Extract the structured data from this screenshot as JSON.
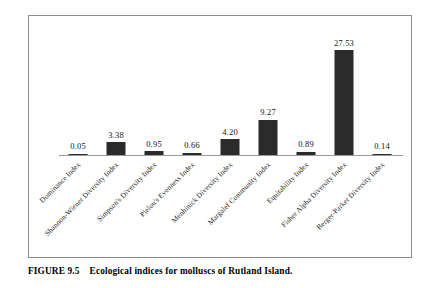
{
  "figure": {
    "caption_label": "FIGURE 9.5",
    "caption_text": "Ecological indices for molluscs of Rutland Island.",
    "frame_color": "#8d8d8d",
    "bar_color": "#2b2b2b",
    "axis_color": "#9a9a9a"
  },
  "chart_data": {
    "type": "bar",
    "title": "",
    "subtitle": "",
    "xlabel": "",
    "ylabel": "",
    "grid": false,
    "legend": null,
    "ylim": [
      0,
      31
    ],
    "categories": [
      "Dominance Index",
      "Shannon-Wiener Diversity Index",
      "Simpson's Diversity Index",
      "Pielou's Evenness Index",
      "Menhinick Diversity Index",
      "Margalef Community Index",
      "Equitability Index",
      "Fisher Alpha Diversity Index",
      "Berger-Parker Diversity Index"
    ],
    "values": [
      0.05,
      3.38,
      0.95,
      0.66,
      4.2,
      9.27,
      0.89,
      27.53,
      0.14
    ],
    "value_labels": [
      "0.05",
      "3.38",
      "0.95",
      "0.66",
      "4.20",
      "9.27",
      "0.89",
      "27.53",
      "0.14"
    ]
  }
}
